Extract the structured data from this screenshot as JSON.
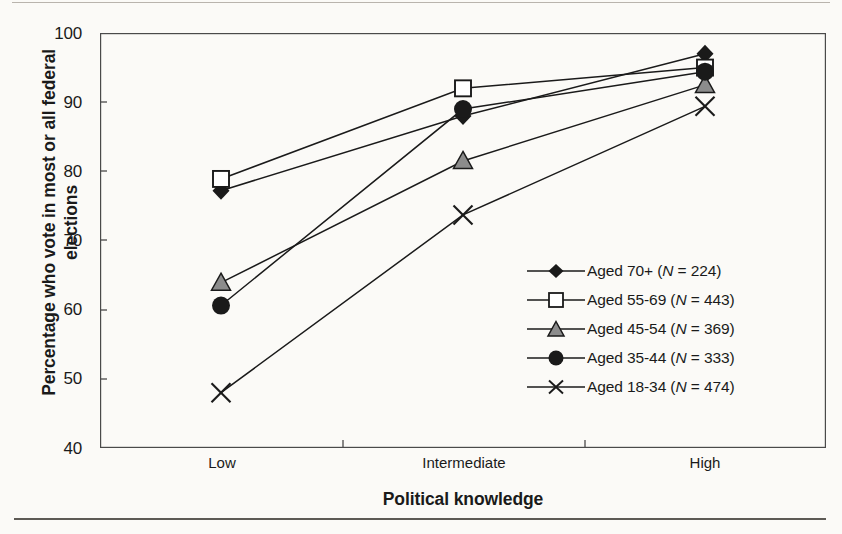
{
  "figure": {
    "y_axis_title": "Percentage who vote in most or all federal elections",
    "x_axis_title": "Political knowledge",
    "y_ticks": [
      "100",
      "90",
      "80",
      "70",
      "60",
      "50",
      "40"
    ],
    "x_ticks": [
      "Low",
      "Intermediate",
      "High"
    ]
  },
  "legend": {
    "entries": [
      {
        "marker": "filled-diamond-marker",
        "label_prefix": "Aged 70+ (",
        "label_n": "N",
        "label_suffix": " = 224)"
      },
      {
        "marker": "open-square-marker",
        "label_prefix": "Aged 55-69 (",
        "label_n": "N",
        "label_suffix": " = 443)"
      },
      {
        "marker": "gray-triangle-marker",
        "label_prefix": "Aged 45-54 (",
        "label_n": "N",
        "label_suffix": " = 369)"
      },
      {
        "marker": "filled-circle-marker",
        "label_prefix": "Aged 35-44 (",
        "label_n": "N",
        "label_suffix": " = 333)"
      },
      {
        "marker": "cross-marker",
        "label_prefix": "Aged 18-34 (",
        "label_n": "N",
        "label_suffix": " = 474)"
      }
    ]
  },
  "chart_data": {
    "type": "line",
    "title": "",
    "xlabel": "Political knowledge",
    "ylabel": "Percentage who vote in most or all federal elections",
    "categories": [
      "Low",
      "Intermediate",
      "High"
    ],
    "ylim": [
      40,
      100
    ],
    "yticks": [
      40,
      50,
      60,
      70,
      80,
      90,
      100
    ],
    "grid": false,
    "legend_position": "inside-lower-right",
    "series": [
      {
        "name": "Aged 70+ (N = 224)",
        "n": 224,
        "marker": "filled-diamond",
        "values": [
          77.2,
          88.0,
          97.0
        ]
      },
      {
        "name": "Aged 55-69 (N = 443)",
        "n": 443,
        "marker": "open-square",
        "values": [
          78.9,
          92.0,
          95.0
        ]
      },
      {
        "name": "Aged 45-54 (N = 369)",
        "n": 369,
        "marker": "gray-triangle",
        "values": [
          63.9,
          81.5,
          92.5
        ]
      },
      {
        "name": "Aged 35-44 (N = 333)",
        "n": 333,
        "marker": "filled-circle",
        "values": [
          60.6,
          89.0,
          94.4
        ]
      },
      {
        "name": "Aged 18-34 (N = 474)",
        "n": 474,
        "marker": "cross",
        "values": [
          48.0,
          73.7,
          89.4
        ]
      }
    ]
  },
  "colors": {
    "ink": "#1a1a1a",
    "paper": "#fbfaf7",
    "triangle_fill": "#8c8c8c",
    "rule_light": "#b9b4ad",
    "rule_dark": "#5d5a55"
  }
}
